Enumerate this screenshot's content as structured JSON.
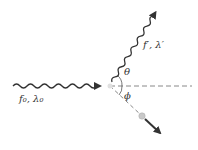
{
  "diagram": {
    "incident_photon": {
      "label": "f₀, λ₀"
    },
    "scattered_photon": {
      "label": "f′, λ′"
    },
    "photon_angle": {
      "label": "θ"
    },
    "electron_angle": {
      "label": "ϕ"
    },
    "colors": {
      "line": "#333333",
      "dashed": "#888888",
      "electron": "#c8c8c8"
    }
  }
}
